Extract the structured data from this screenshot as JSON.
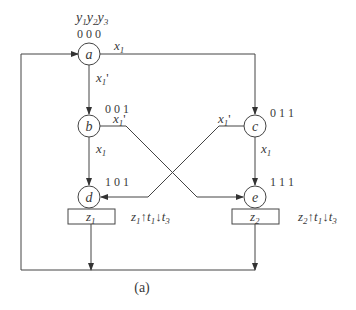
{
  "diagram": {
    "header": {
      "state_vars": [
        "y1",
        "y2",
        "y3"
      ]
    },
    "states": [
      {
        "id": "a",
        "label": "a",
        "code": "0 0 0"
      },
      {
        "id": "b",
        "label": "b",
        "code": "0 0 1"
      },
      {
        "id": "c",
        "label": "c",
        "code": "0 1 1"
      },
      {
        "id": "d",
        "label": "d",
        "code": "1 0 1"
      },
      {
        "id": "e",
        "label": "e",
        "code": "1 1 1"
      }
    ],
    "outputs": [
      {
        "state": "d",
        "label": "z1",
        "action": "z1↑t1↓t3"
      },
      {
        "state": "e",
        "label": "z2",
        "action": "z2↑t1↓t3"
      }
    ],
    "transitions": [
      {
        "from": "a",
        "to": "c",
        "cond": "x1"
      },
      {
        "from": "a",
        "to": "b",
        "cond": "x1'"
      },
      {
        "from": "b",
        "to": "d",
        "cond": "x1"
      },
      {
        "from": "b",
        "to": "e",
        "cond": "x1'"
      },
      {
        "from": "c",
        "to": "e",
        "cond": "x1"
      },
      {
        "from": "c",
        "to": "d",
        "cond": "x1'"
      },
      {
        "from": "d",
        "to": "a",
        "cond": ""
      },
      {
        "from": "e",
        "to": "a",
        "cond": ""
      }
    ],
    "caption": "(a)"
  },
  "colors": {
    "line": "#444444",
    "text": "#3a3a3a",
    "background": "#ffffff"
  }
}
